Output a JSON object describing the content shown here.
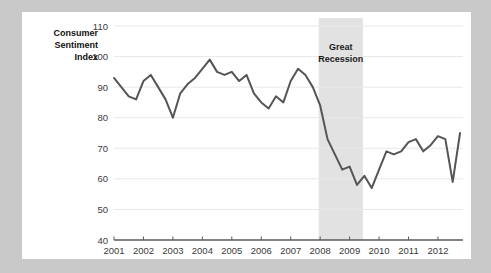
{
  "card": {
    "background_color": "#ffffff",
    "page_background_color": "#c9c9c9"
  },
  "axis_title": {
    "line1": "Consumer",
    "line2": "Sentiment",
    "line3": "Index"
  },
  "annotation": {
    "line1": "Great",
    "line2": "Recession",
    "band_start": 2007.95,
    "band_end": 2009.45,
    "band_color": "#e2e2e2"
  },
  "chart_data": {
    "type": "line",
    "title": "",
    "subtitle": "",
    "xlabel": "",
    "ylabel": "Consumer Sentiment Index",
    "xlim": [
      2001,
      2012.85
    ],
    "ylim": [
      40,
      110
    ],
    "grid": true,
    "legend_position": "none",
    "line_color": "#555555",
    "line_width": 2,
    "ytick_labels": [
      "40",
      "50",
      "60",
      "70",
      "80",
      "90",
      "100",
      "110"
    ],
    "yticks": [
      40,
      50,
      60,
      70,
      80,
      90,
      100,
      110
    ],
    "xtick_labels": [
      "2001",
      "2002",
      "2003",
      "2004",
      "2005",
      "2006",
      "2007",
      "2008",
      "2009",
      "2010",
      "2011",
      "2012"
    ],
    "xticks": [
      2001,
      2002,
      2003,
      2004,
      2005,
      2006,
      2007,
      2008,
      2009,
      2010,
      2011,
      2012
    ],
    "series": [
      {
        "name": "Consumer Sentiment Index",
        "x": [
          2001.0,
          2001.25,
          2001.5,
          2001.75,
          2002.0,
          2002.25,
          2002.5,
          2002.75,
          2003.0,
          2003.25,
          2003.5,
          2003.75,
          2004.0,
          2004.25,
          2004.5,
          2004.75,
          2005.0,
          2005.25,
          2005.5,
          2005.75,
          2006.0,
          2006.25,
          2006.5,
          2006.75,
          2007.0,
          2007.25,
          2007.5,
          2007.75,
          2008.0,
          2008.25,
          2008.5,
          2008.75,
          2009.0,
          2009.25,
          2009.5,
          2009.75,
          2010.0,
          2010.25,
          2010.5,
          2010.75,
          2011.0,
          2011.25,
          2011.5,
          2011.75,
          2012.0,
          2012.25,
          2012.5,
          2012.75
        ],
        "y": [
          93,
          90,
          87,
          86,
          92,
          94,
          90,
          86,
          80,
          88,
          91,
          93,
          96,
          99,
          95,
          94,
          95,
          92,
          94,
          88,
          85,
          83,
          87,
          85,
          92,
          96,
          94,
          90,
          84,
          73,
          68,
          63,
          64,
          58,
          61,
          57,
          63,
          69,
          68,
          69,
          72,
          73,
          69,
          71,
          74,
          73,
          59,
          75
        ]
      }
    ]
  }
}
